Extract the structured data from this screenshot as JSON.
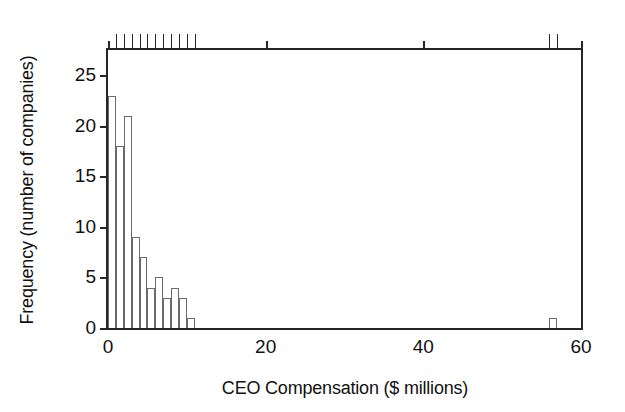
{
  "chart_data": {
    "type": "bar",
    "title": "",
    "subtitle": "",
    "xlabel": "CEO Compensation ($ millions)",
    "ylabel": "Frequency (number of companies)",
    "xlim": [
      0,
      60
    ],
    "ylim": [
      0,
      27.5
    ],
    "bin_width": 1,
    "grid": false,
    "legend": null,
    "xticks": [
      0,
      20,
      40,
      60
    ],
    "xtick_labels": [
      "0",
      "20",
      "40",
      "60"
    ],
    "xminor_ticks": [
      1,
      2,
      3,
      4,
      5,
      6,
      7,
      8,
      9,
      10,
      11,
      56,
      57
    ],
    "yticks": [
      0,
      5,
      10,
      15,
      20,
      25
    ],
    "ytick_labels": [
      "0",
      "5",
      "10",
      "15",
      "20",
      "25"
    ],
    "bins": [
      {
        "x0": 0,
        "x1": 1,
        "value": 23
      },
      {
        "x0": 1,
        "x1": 2,
        "value": 18
      },
      {
        "x0": 2,
        "x1": 3,
        "value": 21
      },
      {
        "x0": 3,
        "x1": 4,
        "value": 9
      },
      {
        "x0": 4,
        "x1": 5,
        "value": 7
      },
      {
        "x0": 5,
        "x1": 6,
        "value": 4
      },
      {
        "x0": 6,
        "x1": 7,
        "value": 5
      },
      {
        "x0": 7,
        "x1": 8,
        "value": 3
      },
      {
        "x0": 8,
        "x1": 9,
        "value": 4
      },
      {
        "x0": 9,
        "x1": 10,
        "value": 3
      },
      {
        "x0": 10,
        "x1": 11,
        "value": 1
      },
      {
        "x0": 56,
        "x1": 57,
        "value": 1
      }
    ],
    "categories": [
      "0-1",
      "1-2",
      "2-3",
      "3-4",
      "4-5",
      "5-6",
      "6-7",
      "7-8",
      "8-9",
      "9-10",
      "10-11",
      "56-57"
    ],
    "values": [
      23,
      18,
      21,
      9,
      7,
      4,
      5,
      3,
      4,
      3,
      1,
      1
    ],
    "colors": {
      "axis": "#262626",
      "bar_edge": "#6b6b6b",
      "bar_fill": "#ffffff",
      "text": "#111111",
      "background": "#ffffff"
    }
  }
}
